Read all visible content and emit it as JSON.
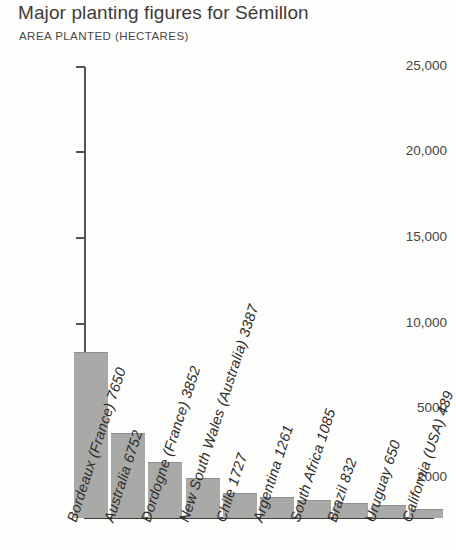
{
  "chart_data": {
    "type": "bar",
    "title": "Major planting figures for Sémillon",
    "subtitle": "AREA PLANTED (HECTARES)",
    "xlabel": "",
    "ylabel": "AREA PLANTED (HECTARES)",
    "grid": false,
    "legend": false,
    "ylim": [
      0,
      25000
    ],
    "ytick_labels": [
      "25,000",
      "20,000",
      "15,000",
      "10,000",
      "5000",
      "2000"
    ],
    "ytick_values": [
      25000,
      20000,
      15000,
      10000,
      5000,
      2000
    ],
    "categories": [
      "Bordeaux (France)",
      "Australia",
      "Dordogne (France)",
      "New South Wales (Australia)",
      "Chile",
      "Argentina",
      "South Africa",
      "Brazil",
      "Uruguay",
      "California (USA)"
    ],
    "values": [
      7650,
      6752,
      3852,
      3387,
      1727,
      1261,
      1085,
      832,
      650,
      439
    ],
    "bar_labels": [
      "Bordeaux (France) 7650",
      "Australia 6752",
      "Dordogne (France) 3852",
      "New South Wales (Australia) 3387",
      "Chile 1727",
      "Argentina 1261",
      "South Africa 1085",
      "Brazil 832",
      "Uruguay 650",
      "California (USA) 439"
    ],
    "bar_color": "#a9a9a7",
    "axis_color": "#3f3d3a",
    "text_color": "#3a3a38",
    "background_color": "#fdfdfb"
  }
}
